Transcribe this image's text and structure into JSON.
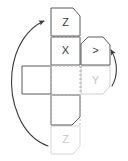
{
  "diagram": {
    "type": "box-net-folding-diagram",
    "title": "",
    "colors": {
      "solid_stroke": "#555555",
      "ghost_stroke": "#cfcfcf",
      "fold_line": "#b9b9b9",
      "arrow": "#3a3a3a",
      "label_solid": "#3a3a3a",
      "label_ghost": "#c8c8c8",
      "background": "#ffffff"
    },
    "faces": [
      {
        "id": "top-z",
        "label": "Z",
        "state": "solid",
        "position": "top",
        "chamfer": "top-right",
        "rect": {
          "x": 51,
          "y": 8,
          "w": 29,
          "h": 28
        }
      },
      {
        "id": "center-x",
        "label": "X",
        "state": "solid",
        "position": "center",
        "chamfer": "none",
        "rect": {
          "x": 51,
          "y": 37,
          "w": 29,
          "h": 28
        }
      },
      {
        "id": "right-y-rotated",
        "label": ">",
        "state": "solid",
        "position": "right-of-center",
        "chamfer": "top-left-and-top-right",
        "rect": {
          "x": 81,
          "y": 37,
          "w": 29,
          "h": 28
        }
      },
      {
        "id": "ghost-y",
        "label": "Y",
        "state": "ghost",
        "position": "lower-right",
        "chamfer": "bottom-right",
        "rect": {
          "x": 81,
          "y": 66,
          "w": 29,
          "h": 28
        }
      },
      {
        "id": "left-blank",
        "label": "",
        "state": "solid",
        "position": "left",
        "chamfer": "none",
        "rect": {
          "x": 22,
          "y": 66,
          "w": 29,
          "h": 28
        }
      },
      {
        "id": "bottom-blank",
        "label": "",
        "state": "solid",
        "position": "bottom",
        "chamfer": "bottom-right",
        "rect": {
          "x": 51,
          "y": 95,
          "w": 29,
          "h": 30
        }
      },
      {
        "id": "ghost-z",
        "label": "Z",
        "state": "ghost",
        "position": "bottom-most",
        "chamfer": "bottom-right",
        "rect": {
          "x": 51,
          "y": 126,
          "w": 29,
          "h": 28
        }
      }
    ],
    "fold_lines": [
      {
        "id": "fold-top",
        "orientation": "horizontal",
        "x1": 51,
        "y1": 37,
        "x2": 80,
        "y2": 37
      },
      {
        "id": "fold-bottom",
        "orientation": "horizontal",
        "x1": 51,
        "y1": 66,
        "x2": 80,
        "y2": 66
      },
      {
        "id": "fold-bottom-2",
        "orientation": "horizontal",
        "x1": 51,
        "y1": 95,
        "x2": 80,
        "y2": 95
      },
      {
        "id": "fold-left",
        "orientation": "vertical",
        "x1": 51,
        "y1": 66,
        "x2": 51,
        "y2": 95
      },
      {
        "id": "fold-right",
        "orientation": "vertical",
        "x1": 80,
        "y1": 66,
        "x2": 80,
        "y2": 95
      }
    ],
    "arrows": [
      {
        "id": "left-fold-arrow",
        "direction": "counterclockwise-up",
        "description": "large curved arrow sweeping from lower area up to the top face",
        "head_at": {
          "x": 46,
          "y": 21
        }
      },
      {
        "id": "right-fold-arrow",
        "direction": "counterclockwise-up",
        "description": "small curved arrow sweeping up toward the right face",
        "head_at": {
          "x": 110,
          "y": 47
        }
      }
    ],
    "legend": {
      "axis_labels": [
        "X",
        "Y",
        "Z"
      ],
      "note": ""
    }
  }
}
